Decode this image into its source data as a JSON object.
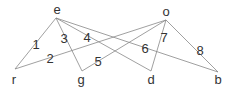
{
  "diagram": {
    "type": "bipartite-graph",
    "nodes": [
      {
        "id": "e",
        "label": "e",
        "x": 56,
        "y": 18,
        "lx": 57,
        "ly": 14
      },
      {
        "id": "o",
        "label": "o",
        "x": 166,
        "y": 20,
        "lx": 166,
        "ly": 16
      },
      {
        "id": "r",
        "label": "r",
        "x": 15,
        "y": 69,
        "lx": 14,
        "ly": 84
      },
      {
        "id": "g",
        "label": "g",
        "x": 82,
        "y": 71,
        "lx": 81,
        "ly": 84
      },
      {
        "id": "d",
        "label": "d",
        "x": 151,
        "y": 71,
        "lx": 151,
        "ly": 84
      },
      {
        "id": "b",
        "label": "b",
        "x": 218,
        "y": 72,
        "lx": 218,
        "ly": 84
      }
    ],
    "edges": [
      {
        "from": "e",
        "to": "r",
        "label": "1",
        "lx": 36,
        "ly": 49
      },
      {
        "from": "o",
        "to": "r",
        "label": "2",
        "lx": 50,
        "ly": 63
      },
      {
        "from": "e",
        "to": "g",
        "label": "3",
        "lx": 64,
        "ly": 43
      },
      {
        "from": "e",
        "to": "d",
        "label": "4",
        "lx": 87,
        "ly": 42
      },
      {
        "from": "o",
        "to": "g",
        "label": "5",
        "lx": 98,
        "ly": 66
      },
      {
        "from": "e",
        "to": "b",
        "label": "6",
        "lx": 145,
        "ly": 53
      },
      {
        "from": "o",
        "to": "d",
        "label": "7",
        "lx": 164,
        "ly": 42
      },
      {
        "from": "o",
        "to": "b",
        "label": "8",
        "lx": 200,
        "ly": 55
      }
    ]
  }
}
